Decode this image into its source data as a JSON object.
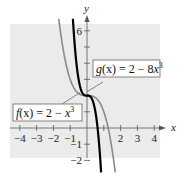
{
  "chart_data": {
    "type": "line",
    "title": "",
    "xlabel": "x",
    "ylabel": "y",
    "xlim": [
      -4.5,
      4.5
    ],
    "ylim": [
      -2.8,
      6.8
    ],
    "x_ticks": [
      -4,
      -3,
      -2,
      -1,
      1,
      2,
      3,
      4
    ],
    "x_tick_labels": [
      "−4",
      "−3",
      "−2",
      "−1",
      "",
      "2",
      "3",
      "4"
    ],
    "y_ticks": [
      -2,
      -1,
      1,
      2,
      3,
      4,
      5,
      6
    ],
    "y_tick_labels": [
      "−2",
      "−1",
      "",
      "",
      "",
      "",
      "",
      "6"
    ],
    "grid": false,
    "series": [
      {
        "name": "f(x) = 2 − x³",
        "expression": "2 - x^3",
        "color": "#8a8a8a"
      },
      {
        "name": "g(x) = 2 − 8x³",
        "expression": "2 - 8x^3",
        "color": "#000000"
      }
    ],
    "annotations": [
      {
        "text_parts": [
          "g",
          "(x) = 2 − 8",
          "x",
          "3"
        ],
        "label": "g(x) = 2 − 8x³"
      },
      {
        "text_parts": [
          "f",
          "(x) = 2 − ",
          "x",
          "3"
        ],
        "label": "f(x) = 2 − x³"
      }
    ],
    "background": "#ebebeb"
  }
}
